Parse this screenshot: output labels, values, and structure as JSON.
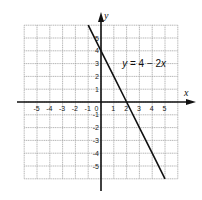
{
  "chart_data": {
    "type": "line",
    "title": "",
    "xlabel": "x",
    "ylabel": "y",
    "xlim": [
      -6,
      6
    ],
    "ylim": [
      -6,
      6
    ],
    "grid": true,
    "x_ticks": [
      "-5",
      "-4",
      "-3",
      "-2",
      "-1",
      "0",
      "1",
      "2",
      "3",
      "4",
      "5"
    ],
    "y_ticks": [
      "5",
      "4",
      "3",
      "2",
      "1",
      "-1",
      "-2",
      "-3",
      "-4",
      "-5"
    ],
    "series": [
      {
        "name": "y = 4 - 2x",
        "x": [
          -1,
          0,
          1,
          2,
          3,
          4,
          5
        ],
        "y": [
          6,
          4,
          2,
          0,
          -2,
          -4,
          -6
        ]
      }
    ],
    "annotations": [
      {
        "text_y": "y",
        "text_eq": " = 4 − 2",
        "text_x": "x",
        "at": [
          1.5,
          3
        ]
      }
    ]
  },
  "colors": {
    "grid": "#9a9a9a",
    "axis": "#111111",
    "line": "#111111"
  }
}
